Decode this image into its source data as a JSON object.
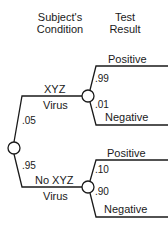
{
  "headers": {
    "condition": [
      "Subject's",
      "Condition"
    ],
    "result": [
      "Test",
      "Result"
    ]
  },
  "tree": {
    "branches": [
      {
        "label": [
          "XYZ",
          "Virus"
        ],
        "probability": ".05",
        "outcomes": [
          {
            "label": "Positive",
            "probability": ".99"
          },
          {
            "label": "Negative",
            "probability": ".01"
          }
        ]
      },
      {
        "label": [
          "No XYZ",
          "Virus"
        ],
        "probability": ".95",
        "outcomes": [
          {
            "label": "Positive",
            "probability": ".10"
          },
          {
            "label": "Negative",
            "probability": ".90"
          }
        ]
      }
    ]
  },
  "colors": {
    "line": "#1a1a1a",
    "background": "#ffffff"
  }
}
